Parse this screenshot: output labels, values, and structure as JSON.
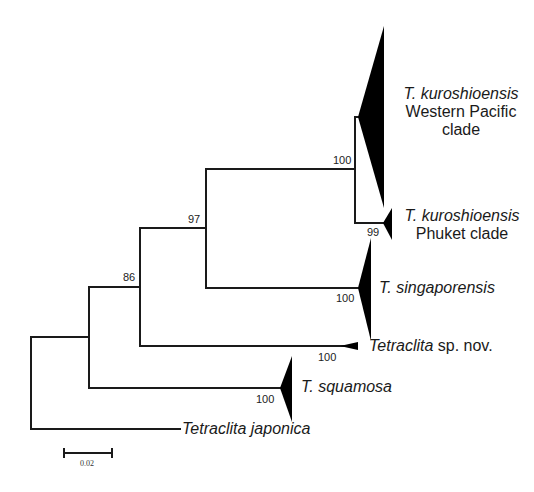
{
  "tree": {
    "taxa": {
      "wp": {
        "italic": "T. kuroshioensis",
        "line2": "Western Pacific",
        "line3": "clade"
      },
      "phuket": {
        "italic": "T. kuroshioensis",
        "line2": "Phuket clade"
      },
      "singaporensis": {
        "italic": "T. singaporensis"
      },
      "spnov": {
        "italic": "Tetraclita",
        "plain": " sp. nov."
      },
      "squamosa": {
        "italic": "T. squamosa"
      },
      "japonica": {
        "italic": "Tetraclita japonica"
      }
    },
    "support": {
      "kuroshio_node": "100",
      "phuket": "99",
      "node97": "97",
      "node86": "86",
      "singaporensis": "100",
      "spnov": "100",
      "squamosa": "100"
    },
    "scale_bar": {
      "label": "0.02"
    },
    "colors": {
      "line": "#1a1a1a",
      "fill": "#000000",
      "background": "#ffffff"
    }
  }
}
